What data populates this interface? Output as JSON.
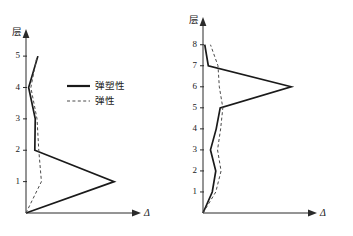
{
  "figure": {
    "background_color": "#ffffff",
    "panel_count": 2
  },
  "legend": {
    "series_solid_label": "弹塑性",
    "series_dashed_label": "弹性",
    "solid_icon": "solid-line-swatch",
    "dashed_icon": "dashed-line-swatch"
  },
  "axis_titles": {
    "y": "层",
    "x": "Δ"
  },
  "chart_data": [
    {
      "type": "line",
      "title": "",
      "subtitle": "",
      "xlabel": "Δ",
      "ylabel": "层",
      "orientation": "horizontal-value-vertical-category",
      "grid": false,
      "legend_position": "inside-upper-right",
      "ylim": [
        0,
        5.45
      ],
      "xlim": [
        0,
        1.18
      ],
      "yticks": [
        1,
        2,
        3,
        4,
        5
      ],
      "ytick_labels": [
        "1",
        "2",
        "3",
        "4",
        "5"
      ],
      "xticks": [],
      "xtick_labels": [],
      "series": [
        {
          "name": "弹塑性",
          "style": "solid",
          "color": "#1a1a1a",
          "points": [
            {
              "x": 0.0,
              "y": 0
            },
            {
              "x": 1.0,
              "y": 1
            },
            {
              "x": 0.1,
              "y": 2
            },
            {
              "x": 0.105,
              "y": 3
            },
            {
              "x": 0.03,
              "y": 4
            },
            {
              "x": 0.135,
              "y": 5
            }
          ]
        },
        {
          "name": "弹性",
          "style": "dashed",
          "color": "#4a4a4a",
          "points": [
            {
              "x": 0.0,
              "y": 0
            },
            {
              "x": 0.175,
              "y": 1
            },
            {
              "x": 0.145,
              "y": 2
            },
            {
              "x": 0.125,
              "y": 3
            },
            {
              "x": 0.055,
              "y": 4
            },
            {
              "x": 0.125,
              "y": 5
            }
          ]
        }
      ]
    },
    {
      "type": "line",
      "title": "",
      "subtitle": "",
      "xlabel": "Δ",
      "ylabel": "层",
      "orientation": "horizontal-value-vertical-category",
      "grid": false,
      "legend_position": "none",
      "ylim": [
        0,
        8.7
      ],
      "xlim": [
        0,
        1.18
      ],
      "yticks": [
        1,
        2,
        3,
        4,
        5,
        6,
        7,
        8
      ],
      "ytick_labels": [
        "1",
        "2",
        "3",
        "4",
        "5",
        "6",
        "7",
        "8"
      ],
      "xticks": [],
      "xtick_labels": [],
      "series": [
        {
          "name": "弹塑性",
          "style": "solid",
          "color": "#1a1a1a",
          "points": [
            {
              "x": 0.0,
              "y": 0
            },
            {
              "x": 0.105,
              "y": 1
            },
            {
              "x": 0.145,
              "y": 2
            },
            {
              "x": 0.085,
              "y": 3
            },
            {
              "x": 0.15,
              "y": 4
            },
            {
              "x": 0.195,
              "y": 5
            },
            {
              "x": 1.0,
              "y": 6
            },
            {
              "x": 0.06,
              "y": 7
            },
            {
              "x": 0.02,
              "y": 8
            }
          ]
        },
        {
          "name": "弹性",
          "style": "dashed",
          "color": "#4a4a4a",
          "points": [
            {
              "x": 0.0,
              "y": 0
            },
            {
              "x": 0.145,
              "y": 1
            },
            {
              "x": 0.205,
              "y": 2
            },
            {
              "x": 0.165,
              "y": 3
            },
            {
              "x": 0.2,
              "y": 4
            },
            {
              "x": 0.225,
              "y": 5
            },
            {
              "x": 0.185,
              "y": 6
            },
            {
              "x": 0.17,
              "y": 7
            },
            {
              "x": 0.085,
              "y": 8
            }
          ]
        }
      ]
    }
  ]
}
